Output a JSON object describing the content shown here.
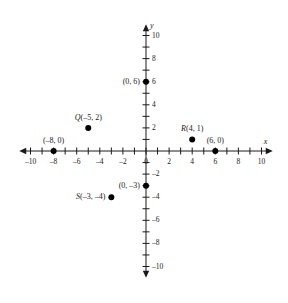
{
  "chart_data": {
    "type": "scatter",
    "title": "",
    "xlabel": "x",
    "ylabel": "y",
    "xlim": [
      -10.8,
      10.8
    ],
    "ylim": [
      -10.8,
      10.8
    ],
    "grid": false,
    "legend": "none",
    "x_tick_labels": [
      "-10",
      "-8",
      "-6",
      "-4",
      "-2",
      "0",
      "2",
      "4",
      "6",
      "8",
      "10"
    ],
    "x_tick_values": [
      -10,
      -8,
      -6,
      -4,
      -2,
      0,
      2,
      4,
      6,
      8,
      10
    ],
    "x_minor_ticks": [
      -9,
      -7,
      -5,
      -3,
      -1,
      1,
      3,
      5,
      7,
      9
    ],
    "y_tick_labels": [
      "10",
      "8",
      "6",
      "4",
      "2",
      "-2",
      "-4",
      "-6",
      "-8",
      "-10"
    ],
    "y_tick_values": [
      10,
      8,
      6,
      4,
      2,
      -2,
      -4,
      -6,
      -8,
      -10
    ],
    "y_minor_ticks": [
      9,
      7,
      5,
      3,
      1,
      -1,
      -3,
      -5,
      -7,
      -9
    ],
    "points": [
      {
        "name": "point-0-6",
        "x": 0,
        "y": 6,
        "label_prefix": "",
        "label": "(0, 6)",
        "label_pos": "left"
      },
      {
        "name": "point-Q",
        "x": -5,
        "y": 2,
        "label_prefix": "Q",
        "label": "(-5, 2)",
        "label_pos": "above"
      },
      {
        "name": "point-R",
        "x": 4,
        "y": 1,
        "label_prefix": "R",
        "label": "(4, 1)",
        "label_pos": "above"
      },
      {
        "name": "point-6-0",
        "x": 6,
        "y": 0,
        "label_prefix": "",
        "label": "(6, 0)",
        "label_pos": "above"
      },
      {
        "name": "point-neg8-0",
        "x": -8,
        "y": 0,
        "label_prefix": "",
        "label": "(-8, 0)",
        "label_pos": "above"
      },
      {
        "name": "point-0-neg3",
        "x": 0,
        "y": -3,
        "label_prefix": "",
        "label": "(0, -3)",
        "label_pos": "left"
      },
      {
        "name": "point-S",
        "x": -3,
        "y": -4,
        "label_prefix": "S",
        "label": "(-3, -4)",
        "label_pos": "left"
      }
    ],
    "colors": {
      "axis": "#1a1a1a",
      "point": "#000000",
      "background": "#ffffff"
    }
  }
}
